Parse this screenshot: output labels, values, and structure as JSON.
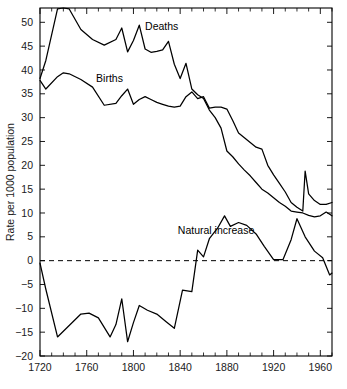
{
  "chart_data": {
    "type": "line",
    "title": "",
    "subtitle": "",
    "xlabel": "",
    "ylabel": "Rate per 1000 population",
    "xlim": [
      1720,
      1970
    ],
    "ylim": [
      -20,
      53
    ],
    "grid": false,
    "legend_position": "inline-annotations",
    "x_ticks": [
      1720,
      1760,
      1800,
      1840,
      1880,
      1920,
      1960
    ],
    "x_tick_labels": [
      "1720",
      "1760",
      "1800",
      "1840",
      "1880",
      "1920",
      "1960"
    ],
    "x_minor_tick_step": 10,
    "y_ticks": [
      -20,
      -15,
      -10,
      -5,
      0,
      5,
      10,
      15,
      20,
      25,
      30,
      35,
      40,
      45,
      50
    ],
    "y_tick_labels": [
      "−20",
      "−15",
      "−10",
      "−5",
      "0",
      "5",
      "10",
      "15",
      "20",
      "25",
      "30",
      "35",
      "40",
      "45",
      "50"
    ],
    "zero_reference_line": {
      "value": 0,
      "style": "dashed"
    },
    "annotations": [
      {
        "text": "Deaths",
        "x": 1810,
        "y": 48.5
      },
      {
        "text": "Births",
        "x": 1768,
        "y": 37.5
      },
      {
        "text": "Natural increase",
        "x": 1838,
        "y": 5.6
      }
    ],
    "series": [
      {
        "name": "Deaths",
        "color": "#000000",
        "x": [
          1720,
          1725,
          1735,
          1740,
          1745,
          1755,
          1765,
          1775,
          1785,
          1790,
          1795,
          1800,
          1805,
          1810,
          1815,
          1820,
          1825,
          1830,
          1835,
          1840,
          1845,
          1850,
          1855,
          1860,
          1865,
          1870,
          1875,
          1880,
          1885,
          1890,
          1895,
          1900,
          1905,
          1910,
          1915,
          1920,
          1925,
          1930,
          1935,
          1940,
          1945,
          1950,
          1955,
          1960,
          1965,
          1970
        ],
        "values": [
          38.2,
          42.0,
          52.8,
          53.0,
          52.8,
          48.5,
          46.4,
          45.2,
          46.4,
          48.8,
          43.8,
          46.2,
          49.4,
          44.4,
          43.7,
          43.9,
          44.2,
          46.0,
          41.2,
          38.2,
          41.4,
          36.0,
          34.8,
          34.0,
          31.6,
          30.0,
          27.8,
          23.0,
          21.8,
          20.3,
          19.0,
          17.8,
          16.4,
          15.0,
          14.2,
          13.2,
          12.2,
          11.4,
          10.4,
          10.2,
          10.0,
          9.5,
          9.2,
          9.4,
          10.2,
          9.4
        ]
      },
      {
        "name": "Births",
        "color": "#000000",
        "x": [
          1720,
          1725,
          1735,
          1740,
          1745,
          1755,
          1765,
          1775,
          1785,
          1790,
          1795,
          1800,
          1805,
          1810,
          1815,
          1820,
          1825,
          1830,
          1835,
          1840,
          1845,
          1850,
          1855,
          1860,
          1865,
          1870,
          1875,
          1880,
          1885,
          1890,
          1895,
          1900,
          1905,
          1910,
          1915,
          1920,
          1925,
          1930,
          1935,
          1940,
          1945,
          1947,
          1950,
          1955,
          1960,
          1965,
          1970
        ],
        "values": [
          37.8,
          36.0,
          38.6,
          39.4,
          39.2,
          38.0,
          36.4,
          32.6,
          33.0,
          34.6,
          36.0,
          32.8,
          33.8,
          34.4,
          33.8,
          33.2,
          32.8,
          32.4,
          32.2,
          32.4,
          34.4,
          35.4,
          34.0,
          34.4,
          32.0,
          32.2,
          32.2,
          31.8,
          29.4,
          26.8,
          25.8,
          24.8,
          23.8,
          23.4,
          20.0,
          18.0,
          16.2,
          14.4,
          12.2,
          11.2,
          10.4,
          18.8,
          14.0,
          12.6,
          11.8,
          11.8,
          12.2
        ]
      },
      {
        "name": "Natural increase",
        "color": "#000000",
        "x": [
          1720,
          1725,
          1735,
          1745,
          1755,
          1762,
          1770,
          1780,
          1785,
          1790,
          1795,
          1800,
          1805,
          1812,
          1820,
          1828,
          1835,
          1842,
          1850,
          1855,
          1860,
          1865,
          1872,
          1878,
          1883,
          1890,
          1897,
          1905,
          1912,
          1920,
          1928,
          1935,
          1940,
          1947,
          1955,
          1962,
          1968,
          1970
        ],
        "values": [
          -0.5,
          -6.0,
          -16.0,
          -13.6,
          -11.2,
          -11.0,
          -12.0,
          -16.0,
          -13.4,
          -8.0,
          -17.0,
          -13.0,
          -9.4,
          -10.4,
          -11.2,
          -12.8,
          -14.2,
          -6.2,
          -6.5,
          2.2,
          0.8,
          4.6,
          6.8,
          9.4,
          7.2,
          8.0,
          7.4,
          5.6,
          3.0,
          0.2,
          0.2,
          4.4,
          8.8,
          5.0,
          2.0,
          0.6,
          -3.0,
          -2.6
        ]
      }
    ]
  }
}
